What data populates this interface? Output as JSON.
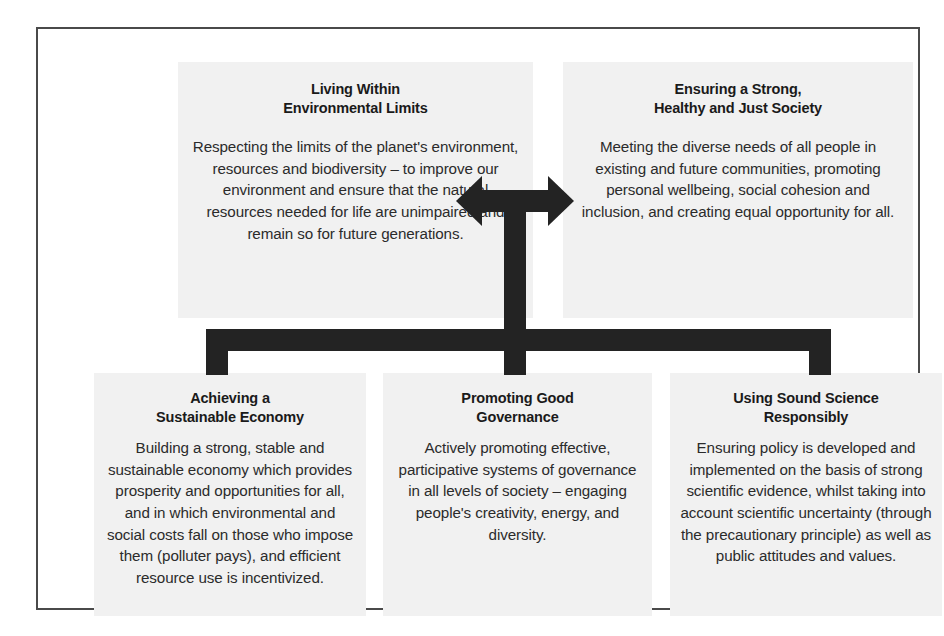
{
  "diagram": {
    "frame_border_color": "#4a4a4a",
    "panel_background": "#f1f1f1",
    "connector_color": "#232323",
    "text_color": "#2b2b2b",
    "top_panels": [
      {
        "id": "environmental-limits",
        "title": "Living Within\nEnvironmental Limits",
        "body": "Respecting the limits of the planet's environment, resources and biodiversity – to improve our environment and ensure that the natural resources needed for life are unimpaired and remain so for future generations."
      },
      {
        "id": "just-society",
        "title": "Ensuring a Strong,\nHealthy and Just Society",
        "body": "Meeting the diverse needs of all people in existing and future communities, promoting personal wellbeing, social cohesion and inclusion, and creating equal opportunity for all."
      }
    ],
    "bottom_panels": [
      {
        "id": "sustainable-economy",
        "title": "Achieving a\nSustainable Economy",
        "body": "Building a strong, stable and sustainable economy which provides prosperity and opportunities for all, and in which environmental and social costs fall on those who impose them (polluter pays), and efficient resource use is incentivized."
      },
      {
        "id": "good-governance",
        "title": "Promoting Good\nGovernance",
        "body": "Actively promoting effective, participative systems of governance in all levels of society – engaging people's creativity, energy, and diversity."
      },
      {
        "id": "sound-science",
        "title": "Using Sound Science\nResponsibly",
        "body": "Ensuring policy is developed and implemented on the basis of strong scientific evidence, whilst taking into account scientific uncertainty (through the precautionary principle) as well as public attitudes and values."
      }
    ],
    "connectors": {
      "double_arrow": "double-headed-horizontal-arrow-with-stem",
      "distribution_bar": "horizontal-bracket-bar-with-three-drops"
    }
  }
}
